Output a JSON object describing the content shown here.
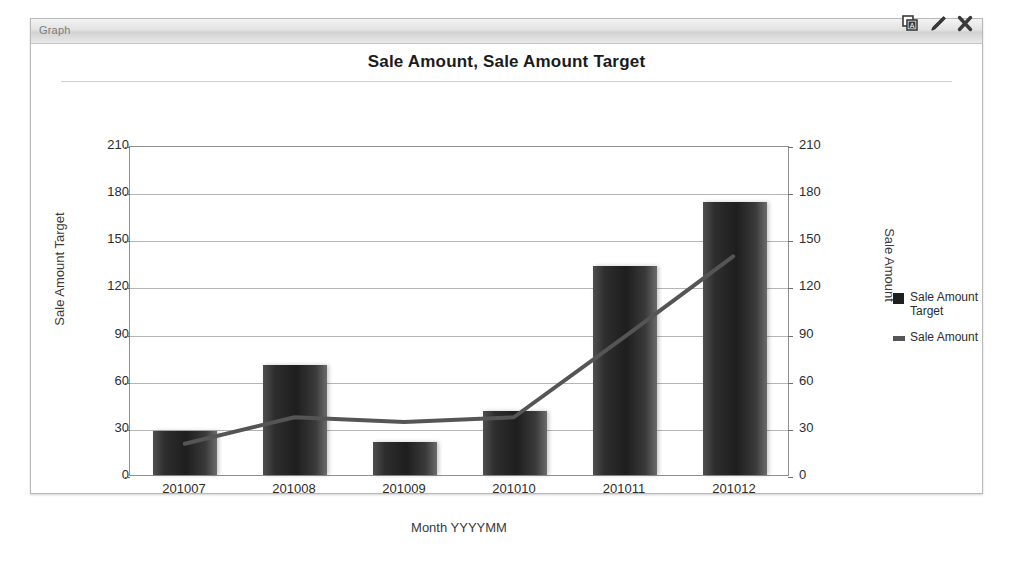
{
  "window": {
    "title": "Graph",
    "icons": [
      {
        "name": "copy-annotate-icon",
        "label": "Copy"
      },
      {
        "name": "edit-pencil-icon",
        "label": "Edit"
      },
      {
        "name": "close-icon",
        "label": "Close"
      }
    ]
  },
  "chart_data": {
    "type": "bar",
    "title": "Sale Amount, Sale Amount Target",
    "xlabel": "Month YYYYMM",
    "categories": [
      "201007",
      "201008",
      "201009",
      "201010",
      "201011",
      "201012"
    ],
    "grid": true,
    "legend_position": "right",
    "axes": {
      "left": {
        "label": "Sale Amount Target",
        "ticks": [
          0,
          30,
          60,
          90,
          120,
          150,
          180,
          210
        ],
        "ylim": [
          0,
          210
        ]
      },
      "right": {
        "label": "Sale Amount",
        "ticks": [
          0,
          30,
          60,
          90,
          120,
          150,
          180,
          210
        ],
        "ylim": [
          0,
          210
        ]
      }
    },
    "series": [
      {
        "name": "Sale Amount Target",
        "render": "bar",
        "axis": "left",
        "color": "#1f1f1f",
        "values": [
          28,
          70,
          21,
          41,
          133,
          174
        ]
      },
      {
        "name": "Sale Amount",
        "render": "line",
        "axis": "right",
        "color": "#555555",
        "values": [
          20,
          37,
          34,
          37,
          88,
          140
        ]
      }
    ]
  }
}
